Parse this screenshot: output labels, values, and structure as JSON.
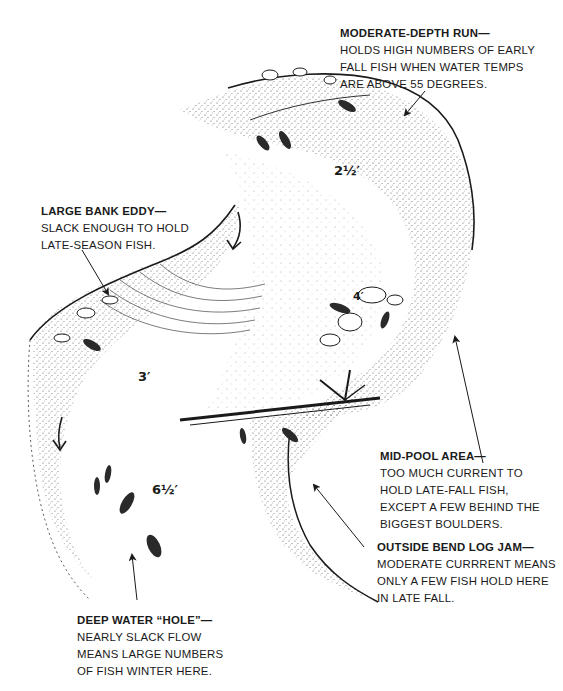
{
  "diagram": {
    "type": "river-pool-illustration",
    "depth_markers": [
      {
        "id": "upper-run",
        "value": "2½′"
      },
      {
        "id": "eddy-side",
        "value": "3′"
      },
      {
        "id": "boulder",
        "value": "4′"
      },
      {
        "id": "hole",
        "value": "6½′"
      }
    ],
    "callouts": [
      {
        "id": "moderate-depth-run",
        "title": "MODERATE-DEPTH RUN—",
        "lines": [
          "HOLDS HIGH NUMBERS OF EARLY",
          "FALL FISH WHEN WATER TEMPS",
          "ARE  ABOVE 55 DEGREES."
        ]
      },
      {
        "id": "large-bank-eddy",
        "title": "LARGE BANK EDDY—",
        "lines": [
          "SLACK ENOUGH TO HOLD",
          "LATE-SEASON FISH."
        ]
      },
      {
        "id": "mid-pool-area",
        "title": "MID-POOL AREA—",
        "lines": [
          "TOO MUCH CURRENT TO",
          "HOLD LATE-FALL FISH,",
          "EXCEPT A FEW BEHIND THE",
          "BIGGEST BOULDERS."
        ]
      },
      {
        "id": "outside-bend-log-jam",
        "title": "OUTSIDE BEND LOG JAM—",
        "lines": [
          "MODERATE CURRRENT MEANS",
          "ONLY A FEW FISH HOLD HERE",
          "IN LATE FALL."
        ]
      },
      {
        "id": "deep-water-hole",
        "title": "DEEP WATER “HOLE”—",
        "lines": [
          "NEARLY SLACK FLOW",
          "MEANS LARGE NUMBERS",
          "OF FISH WINTER HERE."
        ]
      }
    ],
    "colors": {
      "ink": "#1a1a1a",
      "paper": "#ffffff",
      "stipple": "#555555"
    }
  }
}
